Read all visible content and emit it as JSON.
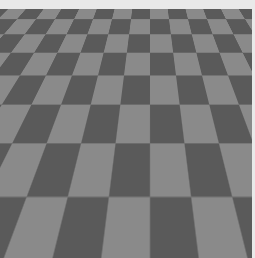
{
  "scene": {
    "description": "3D render of two black cubes on a gray checkerboard floor",
    "colors": {
      "frame": "#e9e9e9",
      "checker_light": "#8a8a8a",
      "checker_dark": "#5a5a5a",
      "cube": "#050505",
      "shadow": "#1e1e1e"
    },
    "objects": [
      {
        "name": "cube-1",
        "position": "center-left"
      },
      {
        "name": "cube-2",
        "position": "bottom-right"
      }
    ]
  }
}
